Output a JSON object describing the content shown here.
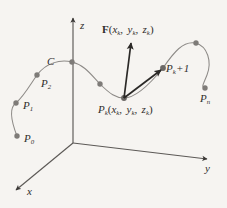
{
  "figure": {
    "background_color": "#f6f4f1",
    "ink_color": "#3a3735",
    "curve_color": "#8d8a87",
    "dot_color": "#7e7b78",
    "arrow_color": "#2b2927"
  },
  "axes": {
    "x": {
      "label": "x",
      "icon": "arrow-down-left-icon"
    },
    "y": {
      "label": "y",
      "icon": "arrow-right-icon"
    },
    "z": {
      "label": "z",
      "icon": "arrow-up-icon"
    },
    "origin": {
      "x": 73,
      "y": 143
    }
  },
  "curve": {
    "name": "C",
    "label": "C"
  },
  "points": [
    {
      "id": "P0",
      "label_html": "P<sub>0</sub>",
      "label_text": "P0",
      "cx": 17,
      "cy": 136
    },
    {
      "id": "P1",
      "label_html": "P<sub>1</sub>",
      "label_text": "P1",
      "cx": 16,
      "cy": 103
    },
    {
      "id": "P2",
      "label_html": "P<sub>2</sub>",
      "label_text": "P2",
      "cx": 37,
      "cy": 75
    },
    {
      "id": "Pc",
      "label_html": "",
      "label_text": "",
      "cx": 72,
      "cy": 62
    },
    {
      "id": "Pm",
      "label_html": "",
      "label_text": "",
      "cx": 100,
      "cy": 84
    },
    {
      "id": "Pk",
      "label_html": "P<sub>k</sub>",
      "label_text": "Pk",
      "cx": 124,
      "cy": 98
    },
    {
      "id": "Pk1",
      "label_html": "P<sub>k+1</sub>",
      "label_text": "Pk+1",
      "cx": 163,
      "cy": 68
    },
    {
      "id": "Ptop",
      "label_html": "",
      "label_text": "",
      "cx": 197,
      "cy": 43
    },
    {
      "id": "Pn",
      "label_html": "P<sub>n</sub>",
      "label_text": "Pn",
      "cx": 205,
      "cy": 88
    }
  ],
  "labels": {
    "curve_C": "C",
    "p0": "P0",
    "p1": "P1",
    "p2": "P2",
    "pk_full": "Pk(xk, yk, zk)",
    "pk1": "Pk+1",
    "pn": "Pn",
    "vector_F": "F(xk, yk, zk)",
    "axis_x": "x",
    "axis_y": "y",
    "axis_z": "z"
  },
  "vectors": [
    {
      "id": "F-vector",
      "name": "field-vector",
      "label": "F(xk, yk, zk)",
      "from": {
        "x": 124,
        "y": 98
      },
      "to": {
        "x": 131,
        "y": 41
      }
    },
    {
      "id": "chord-vector",
      "name": "chord-vector",
      "label": "",
      "from": {
        "x": 124,
        "y": 98
      },
      "to": {
        "x": 162,
        "y": 69
      }
    }
  ]
}
